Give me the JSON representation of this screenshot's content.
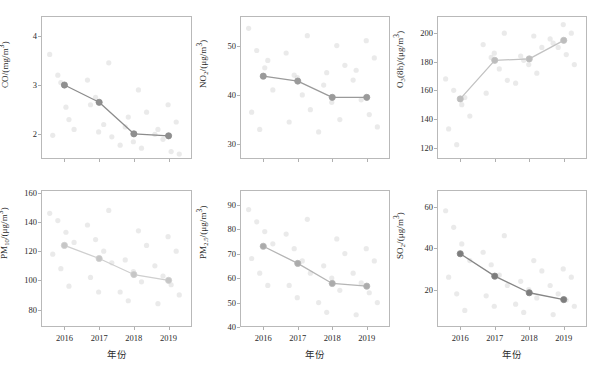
{
  "figure": {
    "xlabel": "年份",
    "categories": [
      "2016",
      "2017",
      "2018",
      "2019"
    ],
    "scatter_color": "#d9d9d9",
    "grid_rows": 2,
    "grid_cols": 3
  },
  "chart_data": [
    {
      "type": "line",
      "id": "co",
      "title": "",
      "ylabel": "CO/(mg/m³)",
      "ylabel_html": "CO/(mg/m<sup>3</sup>)",
      "xlabel": "年份",
      "categories": [
        "2016",
        "2017",
        "2018",
        "2019"
      ],
      "values": [
        3.0,
        2.65,
        2.01,
        1.97
      ],
      "yticks": [
        2,
        3,
        4
      ],
      "ylim": [
        1.5,
        4.4
      ],
      "show_xticklabels": false,
      "grid": false,
      "legend": "none",
      "line_color": "#8c8c8c",
      "marker_color": "#8f8f8f",
      "scatter": [
        [
          3.62,
          3.2,
          2.55,
          2.1,
          1.98,
          3.05,
          2.3
        ],
        [
          3.45,
          3.1,
          2.75,
          2.2,
          1.95,
          2.6,
          2.05
        ],
        [
          2.9,
          2.45,
          2.15,
          1.85,
          1.72,
          1.78,
          2.35
        ],
        [
          2.6,
          2.25,
          2.0,
          1.9,
          1.65,
          1.6,
          2.1
        ]
      ]
    },
    {
      "type": "line",
      "id": "no2",
      "title": "",
      "ylabel": "NO₂/(μg/m³)",
      "ylabel_html": "NO<sub>2</sub>/(μg/m<sup>3</sup>)",
      "xlabel": "年份",
      "categories": [
        "2016",
        "2017",
        "2018",
        "2019"
      ],
      "values": [
        43.8,
        42.8,
        39.5,
        39.5
      ],
      "yticks": [
        30,
        40,
        50
      ],
      "ylim": [
        27,
        56
      ],
      "show_xticklabels": false,
      "grid": false,
      "legend": "none",
      "line_color": "#9a9a9a",
      "marker_color": "#9a9a9a",
      "scatter": [
        [
          53.5,
          49.0,
          45.5,
          41.0,
          36.5,
          33.0,
          47.0
        ],
        [
          52.0,
          48.5,
          44.0,
          40.0,
          37.0,
          34.5,
          43.5
        ],
        [
          50.0,
          46.0,
          42.0,
          38.5,
          35.0,
          32.5,
          44.5
        ],
        [
          51.0,
          47.5,
          43.0,
          39.0,
          36.0,
          33.5,
          45.0
        ]
      ]
    },
    {
      "type": "line",
      "id": "o3_8h",
      "title": "",
      "ylabel": "O₃(8h)/(μg/m³)",
      "ylabel_html": "O<sub>3</sub>(8h)/(μg/m<sup>3</sup>)",
      "xlabel": "年份",
      "categories": [
        "2016",
        "2017",
        "2018",
        "2019"
      ],
      "values": [
        154,
        181,
        182,
        195
      ],
      "yticks": [
        120,
        140,
        160,
        180,
        200
      ],
      "ylim": [
        112,
        212
      ],
      "show_xticklabels": false,
      "grid": false,
      "legend": "none",
      "line_color": "#c2c2c2",
      "marker_color": "#bdbdbd",
      "scatter": [
        [
          168,
          160,
          150,
          142,
          133,
          122,
          155
        ],
        [
          200,
          192,
          183,
          175,
          167,
          158,
          186
        ],
        [
          198,
          190,
          184,
          178,
          172,
          165,
          181
        ],
        [
          206,
          200,
          196,
          190,
          185,
          178,
          193
        ]
      ]
    },
    {
      "type": "line",
      "id": "pm10",
      "title": "",
      "ylabel": "PM₁₀/(μg/m³)",
      "ylabel_html": "PM<sub>10</sub>/(μg/m<sup>3</sup>)",
      "xlabel": "年份",
      "categories": [
        "2016",
        "2017",
        "2018",
        "2019"
      ],
      "values": [
        124,
        115,
        104,
        100
      ],
      "yticks": [
        80,
        100,
        120,
        140,
        160
      ],
      "ylim": [
        68,
        162
      ],
      "show_xticklabels": true,
      "grid": false,
      "legend": "none",
      "line_color": "#cfcfcf",
      "marker_color": "#c6c6c6",
      "scatter": [
        [
          146,
          141,
          133,
          126,
          118,
          108,
          96
        ],
        [
          148,
          138,
          128,
          120,
          112,
          102,
          92
        ],
        [
          134,
          124,
          114,
          106,
          99,
          92,
          86
        ],
        [
          130,
          120,
          110,
          103,
          97,
          90,
          84
        ]
      ]
    },
    {
      "type": "line",
      "id": "pm25",
      "title": "",
      "ylabel": "PM₂.₅/(μg/m³)",
      "ylabel_html": "PM<sub>2.5</sub>/(μg/m<sup>3</sup>)",
      "xlabel": "年份",
      "categories": [
        "2016",
        "2017",
        "2018",
        "2019"
      ],
      "values": [
        73,
        66,
        57.8,
        56.7
      ],
      "yticks": [
        40,
        50,
        60,
        70,
        80,
        90
      ],
      "ylim": [
        40,
        96
      ],
      "show_xticklabels": true,
      "grid": false,
      "legend": "none",
      "line_color": "#b5b5b5",
      "marker_color": "#ababab",
      "scatter": [
        [
          88,
          83,
          79,
          74,
          68,
          62,
          57
        ],
        [
          84,
          78,
          72,
          67,
          62,
          57,
          52
        ],
        [
          76,
          70,
          65,
          60,
          55,
          50,
          46
        ],
        [
          72,
          67,
          62,
          58,
          54,
          50,
          45
        ]
      ]
    },
    {
      "type": "line",
      "id": "so2",
      "title": "",
      "ylabel": "SO₂/(μg/m³)",
      "ylabel_html": "SO<sub>2</sub>/(μg/m<sup>3</sup>)",
      "xlabel": "年份",
      "categories": [
        "2016",
        "2017",
        "2018",
        "2019"
      ],
      "values": [
        37.3,
        26.5,
        18.5,
        15.2
      ],
      "yticks": [
        20,
        40,
        60
      ],
      "ylim": [
        2,
        68
      ],
      "show_xticklabels": true,
      "grid": false,
      "legend": "none",
      "line_color": "#868686",
      "marker_color": "#7d7d7d",
      "scatter": [
        [
          58,
          50,
          42,
          34,
          26,
          18,
          10
        ],
        [
          46,
          38,
          32,
          27,
          22,
          17,
          12
        ],
        [
          34,
          29,
          24,
          20,
          16,
          13,
          9
        ],
        [
          30,
          26,
          22,
          18,
          15,
          12,
          8
        ]
      ]
    }
  ]
}
